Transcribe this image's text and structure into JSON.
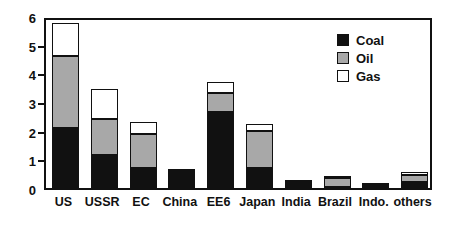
{
  "chart_data": {
    "type": "bar",
    "stacked": true,
    "title": "",
    "xlabel": "",
    "ylabel": "",
    "ylim": [
      0,
      6
    ],
    "yticks": [
      0,
      1,
      2,
      3,
      4,
      5,
      6
    ],
    "ytick_labels": [
      "0",
      "1",
      "2",
      "3",
      "4",
      "5",
      "6"
    ],
    "grid": false,
    "legend_position": "top-right",
    "categories": [
      "US",
      "USSR",
      "EC",
      "China",
      "EE6",
      "Japan",
      "India",
      "Brazil",
      "Indo.",
      "others"
    ],
    "series": [
      {
        "name": "Coal",
        "color": "#111111",
        "values": [
          2.1,
          1.15,
          0.7,
          0.55,
          2.65,
          0.7,
          0.15,
          0.05,
          0.02,
          0.22
        ]
      },
      {
        "name": "Oil",
        "color": "#a8a8a8",
        "values": [
          2.5,
          1.25,
          1.2,
          0.03,
          0.65,
          1.3,
          0.05,
          0.3,
          0.1,
          0.25
        ]
      },
      {
        "name": "Gas",
        "color": "#ffffff",
        "values": [
          1.15,
          1.05,
          0.4,
          0.02,
          0.4,
          0.25,
          0.02,
          0.02,
          0.02,
          0.1
        ]
      }
    ],
    "totals": [
      5.75,
      3.45,
      2.3,
      0.6,
      3.7,
      2.25,
      0.22,
      0.37,
      0.14,
      0.57
    ]
  },
  "legend": {
    "items": [
      {
        "label": "Coal",
        "color": "#111111"
      },
      {
        "label": "Oil",
        "color": "#a8a8a8"
      },
      {
        "label": "Gas",
        "color": "#ffffff"
      }
    ]
  },
  "colors": {
    "coal": "#111111",
    "oil": "#a8a8a8",
    "gas": "#ffffff",
    "axis": "#111111",
    "background": "#ffffff"
  }
}
